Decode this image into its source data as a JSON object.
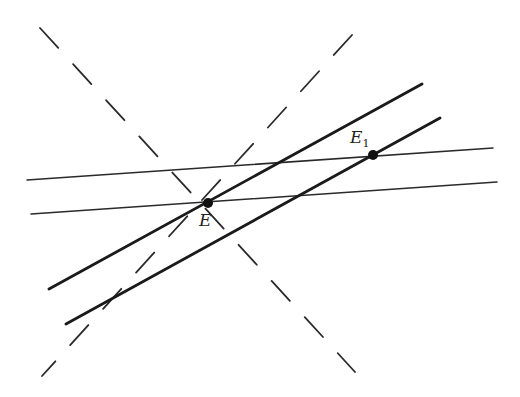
{
  "diagram": {
    "type": "geometry-lines",
    "thin_lines": [
      {
        "x1": 27,
        "y1": 180,
        "x2": 493,
        "y2": 148
      },
      {
        "x1": 31,
        "y1": 214,
        "x2": 497,
        "y2": 182
      }
    ],
    "thick_lines": [
      {
        "x1": 49,
        "y1": 289,
        "x2": 422,
        "y2": 84
      },
      {
        "x1": 66,
        "y1": 324,
        "x2": 440,
        "y2": 118
      }
    ],
    "dashed_lines": [
      {
        "x1": 40,
        "y1": 28,
        "x2": 355,
        "y2": 372
      },
      {
        "x1": 352,
        "y1": 35,
        "x2": 42,
        "y2": 376
      }
    ],
    "points": [
      {
        "name": "E",
        "label": "E",
        "subscript": "",
        "cx": 208,
        "cy": 203
      },
      {
        "name": "E1",
        "label": "E",
        "subscript": "1",
        "cx": 373,
        "cy": 155
      }
    ]
  },
  "labels": {
    "E": {
      "text": "E",
      "sub": ""
    },
    "E1": {
      "text": "E",
      "sub": "1"
    }
  }
}
